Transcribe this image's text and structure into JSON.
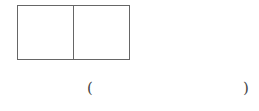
{
  "figure": {
    "shape": "rectangle divided into 2 equal squares",
    "cells": [
      {
        "label": ""
      },
      {
        "label": ""
      }
    ]
  },
  "answer_blank": {
    "open_paren": "(",
    "value": "",
    "close_paren": ")"
  }
}
